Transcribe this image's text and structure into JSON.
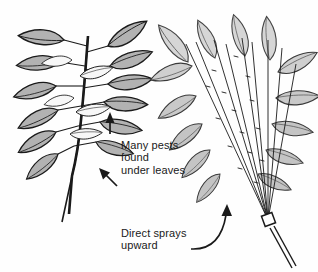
{
  "figure": {
    "background_color": "#fefefe",
    "ink_color": "#1a1a1a",
    "leaf_fill_dark": "#b2b2b2",
    "leaf_fill_light": "#d6d6d6",
    "leaf_fill_pale": "#f2f2f2"
  },
  "callouts": [
    {
      "id": "pests",
      "lines": "Many pests\nfound\nunder leaves",
      "text": "Many pests found under leaves"
    },
    {
      "id": "spray",
      "lines": "Direct sprays\nupward",
      "text": "Direct sprays upward"
    }
  ],
  "annotations": {
    "pests_label": "Many pests\nfound\nunder leaves",
    "spray_label": "Direct sprays\nupward"
  },
  "panels": [
    {
      "id": "left-plant",
      "name": "untreated-plant",
      "description": "Leafy stem shown upright with leaves in opposite pairs"
    },
    {
      "id": "right-plant",
      "name": "sprayed-plant",
      "description": "Leafy stem with spray fan directed upward from a nozzle at the base"
    }
  ],
  "icons": {
    "arrow_up": "arrow-up-icon",
    "arrow_diagonal": "arrow-diagonal-icon",
    "arrow_curved": "arrow-curved-icon",
    "nozzle": "spray-nozzle-icon"
  }
}
